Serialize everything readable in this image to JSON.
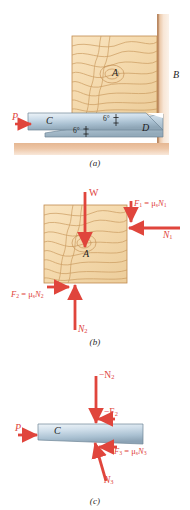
{
  "figure": {
    "colors": {
      "wood_fill": "#f6dcb0",
      "wood_grain": "#c99a5e",
      "wood_edge": "#c08a4e",
      "wall_floor": "#e7bb96",
      "wall_floor_light": "#f7e2cf",
      "wedge_light": "#e3ecf3",
      "wedge_mid": "#b9cbd9",
      "wedge_dark": "#8fa6b8",
      "wedge_edge": "#6f8597",
      "force_red": "#e0453c",
      "label_black": "#1d1d1d"
    }
  },
  "panel_a": {
    "caption": "(a)",
    "block_label": "A",
    "wall_label": "B",
    "wedge_top_label": "C",
    "wedge_bottom_label": "D",
    "force_p": "P",
    "angle_top": "6°",
    "angle_bottom": "6°"
  },
  "panel_b": {
    "caption": "(b)",
    "block_label": "A",
    "force_w": "W",
    "force_f1": "F",
    "force_f1_sub": "1",
    "force_f1_rest": " = μ",
    "force_f1_mu_sub": "s",
    "force_f1_n": "N",
    "force_f1_n_sub": "1",
    "force_n1": "N",
    "force_n1_sub": "1",
    "force_f2": "F",
    "force_f2_sub": "2",
    "force_f2_rest": " = μ",
    "force_f2_mu_sub": "s",
    "force_f2_n": "N",
    "force_f2_n_sub": "2",
    "force_n2": "N",
    "force_n2_sub": "2"
  },
  "panel_c": {
    "caption": "(c)",
    "wedge_label": "C",
    "force_p": "P",
    "force_neg_n2": "−N",
    "force_neg_n2_sub": "2",
    "force_neg_f2": "−F",
    "force_neg_f2_sub": "2",
    "force_n3": "N",
    "force_n3_sub": "3",
    "force_f3": "F",
    "force_f3_sub": "3",
    "force_f3_rest": " = μ",
    "force_f3_mu_sub": "s",
    "force_f3_n": "N",
    "force_f3_n_sub": "3"
  }
}
